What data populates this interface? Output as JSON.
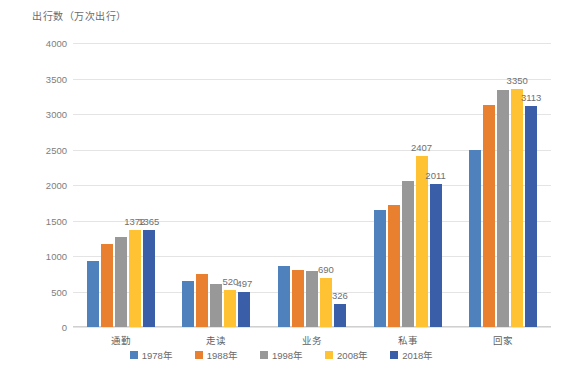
{
  "chart_data": {
    "type": "bar",
    "title": "出行数（万次出行）",
    "xlabel": "",
    "ylabel": "",
    "ylim": [
      0,
      4000
    ],
    "yticks": [
      0,
      500,
      1000,
      1500,
      2000,
      2500,
      3000,
      3500,
      4000
    ],
    "grid": true,
    "legend_position": "bottom",
    "categories": [
      "通勤",
      "走读",
      "业务",
      "私事",
      "回家"
    ],
    "series": [
      {
        "name": "1978年",
        "color": "#4F81BD",
        "values": [
          930,
          650,
          855,
          1655,
          2500
        ],
        "labels": [
          "",
          "",
          "",
          "",
          ""
        ]
      },
      {
        "name": "1988年",
        "color": "#E8802F",
        "values": [
          1165,
          745,
          805,
          1720,
          3130
        ],
        "labels": [
          "",
          "",
          "",
          "",
          ""
        ]
      },
      {
        "name": "1998年",
        "color": "#989898",
        "values": [
          1270,
          610,
          790,
          2055,
          3340
        ],
        "labels": [
          "",
          "",
          "",
          "",
          ""
        ]
      },
      {
        "name": "2008年",
        "color": "#FFC233",
        "values": [
          1372,
          520,
          690,
          2407,
          3350
        ],
        "labels": [
          "1372",
          "520",
          "690",
          "2407",
          "3350"
        ]
      },
      {
        "name": "2018年",
        "color": "#3A5EA8",
        "values": [
          1365,
          497,
          326,
          2011,
          3113
        ],
        "labels": [
          "1365",
          "497",
          "326",
          "2011",
          "3113"
        ]
      }
    ]
  }
}
